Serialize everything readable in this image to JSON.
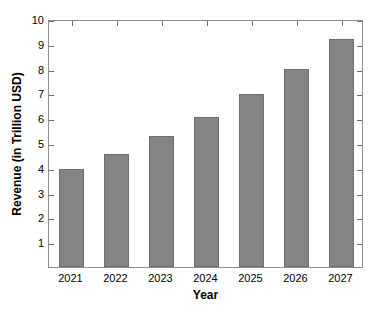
{
  "chart_data": {
    "type": "bar",
    "title": "",
    "xlabel": "Year",
    "ylabel": "Revenue (in Trillion USD)",
    "categories": [
      "2021",
      "2022",
      "2023",
      "2024",
      "2025",
      "2026",
      "2027"
    ],
    "values": [
      3.97,
      4.55,
      5.27,
      6.03,
      6.97,
      8.0,
      9.2
    ],
    "series": [
      {
        "name": "Revenue",
        "values": [
          3.97,
          4.55,
          5.27,
          6.03,
          6.97,
          8.0,
          9.2
        ]
      }
    ],
    "ylim": [
      0,
      10
    ],
    "yticks": [
      1,
      2,
      3,
      4,
      5,
      6,
      7,
      8,
      9,
      10
    ],
    "ytick_labels": [
      "1",
      "2",
      "3",
      "4",
      "5",
      "6",
      "7",
      "8",
      "9",
      "10"
    ],
    "grid": false,
    "legend": null,
    "bar_color": "#848484",
    "bar_edge_color": "#6e6e6e",
    "axis_color": "#8e8e8e",
    "background_color": "#ffffff"
  }
}
